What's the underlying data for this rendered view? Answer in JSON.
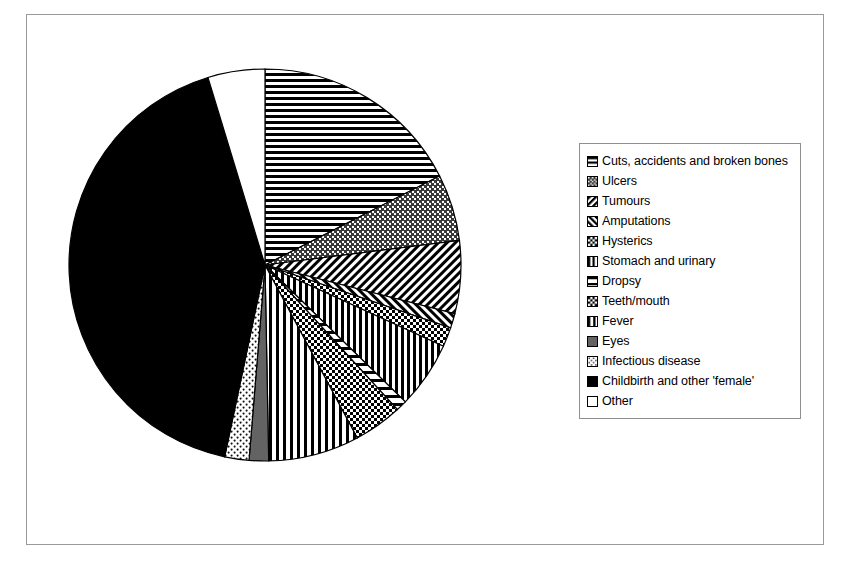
{
  "figure": {
    "kind": "pie-chart-figure",
    "background": "#ffffff",
    "frame_color": "#9a9a9a"
  },
  "legend": {
    "name": "chart-legend",
    "border_color": "#8f8f8f",
    "position": "right",
    "entries": [
      {
        "label": "Cuts, accidents and broken bones",
        "pattern": "horizontal-lines"
      },
      {
        "label": "Ulcers",
        "pattern": "dotted-grid"
      },
      {
        "label": "Tumours",
        "pattern": "diagonal-hatch-down"
      },
      {
        "label": "Amputations",
        "pattern": "diagonal-hatch-up"
      },
      {
        "label": "Hysterics",
        "pattern": "checkerboard"
      },
      {
        "label": "Stomach and urinary",
        "pattern": "vertical-lines"
      },
      {
        "label": "Dropsy",
        "pattern": "horizontal-lines-wide"
      },
      {
        "label": "Teeth/mouth",
        "pattern": "checkerboard"
      },
      {
        "label": "Fever",
        "pattern": "vertical-lines-wide"
      },
      {
        "label": "Eyes",
        "pattern": "solid-gray"
      },
      {
        "label": "Infectious disease",
        "pattern": "fine-dots"
      },
      {
        "label": "Childbirth and other 'female'",
        "pattern": "solid-black"
      },
      {
        "label": "Other",
        "pattern": "white"
      }
    ]
  },
  "chart_data": {
    "type": "pie",
    "title": "",
    "xlabel": "",
    "ylabel": "",
    "start_angle_deg": 0,
    "direction": "clockwise",
    "units": "percent",
    "labels": [
      "Cuts, accidents and broken bones",
      "Ulcers",
      "Tumours",
      "Amputations",
      "Hysterics",
      "Stomach and urinary",
      "Dropsy",
      "Teeth/mouth",
      "Fever",
      "Eyes",
      "Infectious disease",
      "Childbirth and other 'female'",
      "Other"
    ],
    "values": [
      17.5,
      5.5,
      6.0,
      1.2,
      1.6,
      5.5,
      0.9,
      4.0,
      7.5,
      1.6,
      2.0,
      42.0,
      4.7
    ],
    "patterns": [
      "horizontal-lines",
      "dotted-grid",
      "diagonal-hatch-down",
      "diagonal-hatch-up",
      "checkerboard",
      "vertical-lines",
      "horizontal-lines-wide",
      "checkerboard",
      "vertical-lines-wide",
      "solid-gray",
      "fine-dots",
      "solid-black",
      "white"
    ],
    "legend_position": "right",
    "grid": false
  }
}
